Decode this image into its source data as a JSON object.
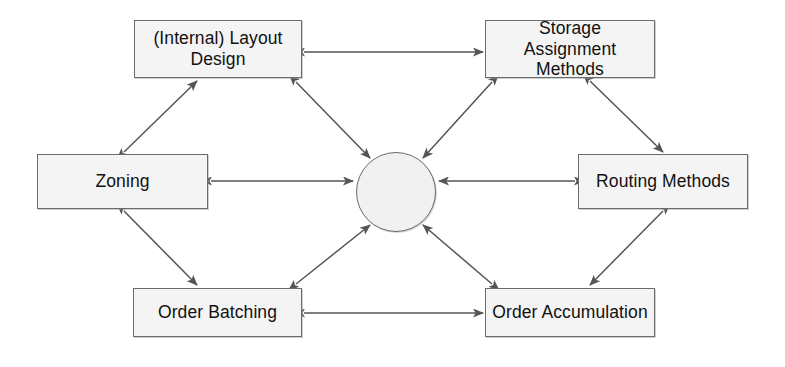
{
  "diagram": {
    "type": "relationship-diagram",
    "background_color": "#ffffff",
    "box_fill_color": "#f4f4f4",
    "box_border_color": "#6b6b6b",
    "arrow_color": "#555555",
    "hub": {
      "label": "",
      "shape": "circle",
      "cx": 396,
      "cy": 192,
      "r": 40
    },
    "nodes": [
      {
        "id": "internal-layout-design",
        "label": "(Internal) Layout\nDesign",
        "x": 134,
        "y": 20,
        "w": 168,
        "h": 58
      },
      {
        "id": "storage-assignment-methods",
        "label": "Storage Assignment\nMethods",
        "x": 485,
        "y": 20,
        "w": 170,
        "h": 58
      },
      {
        "id": "zoning",
        "label": "Zoning",
        "x": 37,
        "y": 154,
        "w": 171,
        "h": 55
      },
      {
        "id": "routing-methods",
        "label": "Routing Methods",
        "x": 578,
        "y": 154,
        "w": 170,
        "h": 55
      },
      {
        "id": "order-batching",
        "label": "Order Batching",
        "x": 133,
        "y": 288,
        "w": 169,
        "h": 49
      },
      {
        "id": "order-accumulation",
        "label": "Order Accumulation",
        "x": 485,
        "y": 288,
        "w": 170,
        "h": 49
      }
    ],
    "connections": [
      {
        "id": "layout-to-storage",
        "from": "internal-layout-design",
        "to": "storage-assignment-methods",
        "style": "double-headed"
      },
      {
        "id": "zoning-to-layout",
        "from": "zoning",
        "to": "internal-layout-design",
        "style": "double-headed"
      },
      {
        "id": "zoning-to-order-batching",
        "from": "zoning",
        "to": "order-batching",
        "style": "double-headed"
      },
      {
        "id": "storage-to-routing",
        "from": "storage-assignment-methods",
        "to": "routing-methods",
        "style": "double-headed"
      },
      {
        "id": "routing-to-order-accumulation",
        "from": "routing-methods",
        "to": "order-accumulation",
        "style": "double-headed"
      },
      {
        "id": "order-batching-to-order-accumulation",
        "from": "order-batching",
        "to": "order-accumulation",
        "style": "double-headed"
      },
      {
        "id": "layout-to-hub",
        "from": "internal-layout-design",
        "to": "hub",
        "style": "double-headed"
      },
      {
        "id": "storage-to-hub",
        "from": "storage-assignment-methods",
        "to": "hub",
        "style": "double-headed"
      },
      {
        "id": "zoning-to-hub",
        "from": "zoning",
        "to": "hub",
        "style": "double-headed"
      },
      {
        "id": "routing-to-hub",
        "from": "routing-methods",
        "to": "hub",
        "style": "double-headed"
      },
      {
        "id": "order-batching-to-hub",
        "from": "order-batching",
        "to": "hub",
        "style": "double-headed"
      },
      {
        "id": "order-accumulation-to-hub",
        "from": "order-accumulation",
        "to": "hub",
        "style": "double-headed"
      }
    ]
  }
}
